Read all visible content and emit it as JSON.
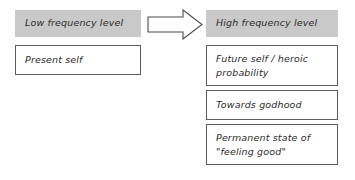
{
  "diagram": {
    "title_low": "Low frequency level",
    "title_high": "High frequency level",
    "arrow_icon": "right-block-arrow-icon",
    "colors": {
      "header_fill": "#c9c9c9",
      "box_border": "#5b5b5b",
      "text": "#2b2b2b",
      "background": "#ffffff"
    },
    "columns": [
      {
        "id": "low-frequency",
        "header": "Low frequency level",
        "items": [
          {
            "text": "Present self"
          }
        ]
      },
      {
        "id": "high-frequency",
        "header": "High frequency level",
        "items": [
          {
            "text": "Future self / heroic probability"
          },
          {
            "text": "Towards godhood"
          },
          {
            "text": "Permanent state of \"feeling good\""
          }
        ]
      }
    ]
  }
}
